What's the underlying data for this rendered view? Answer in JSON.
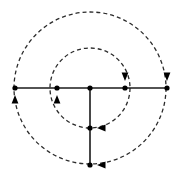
{
  "figure": {
    "background_color": "#ffffff",
    "width": 180,
    "height": 180,
    "stroke_color": "#1a1a1a",
    "dash_color": "#2b2b2b",
    "node_color": "#000000",
    "arrow_color": "#000000",
    "solid_line_width": 1.6,
    "dashed_line_width": 1.3,
    "dash_pattern": "4 3",
    "node_radius": 2.6
  },
  "geometry": {
    "center": {
      "x": 90,
      "y": 88,
      "label": "center-node"
    },
    "circles": [
      {
        "name": "inner-circle",
        "cx": 90,
        "cy": 88,
        "r": 40,
        "style": "dashed",
        "direction": "clockwise"
      },
      {
        "name": "outer-circle",
        "cx": 90,
        "cy": 88,
        "r": 76,
        "style": "dashed",
        "direction": "clockwise"
      }
    ],
    "horizontal_line": {
      "name": "horizontal-diameter",
      "x1": 15,
      "y1": 88,
      "x2": 167,
      "y2": 88,
      "style": "solid"
    },
    "vertical_line": {
      "name": "vertical-radius",
      "x1": 90,
      "y1": 88,
      "x2": 90,
      "y2": 165,
      "style": "solid"
    },
    "nodes": [
      {
        "name": "node-outer-left",
        "x": 15,
        "y": 88
      },
      {
        "name": "node-inner-left",
        "x": 57,
        "y": 88
      },
      {
        "name": "node-center",
        "x": 90,
        "y": 88
      },
      {
        "name": "node-inner-right",
        "x": 125,
        "y": 88
      },
      {
        "name": "node-outer-right",
        "x": 167,
        "y": 88
      },
      {
        "name": "node-inner-bottom",
        "x": 90,
        "y": 128
      },
      {
        "name": "node-outer-bottom",
        "x": 90,
        "y": 165
      }
    ],
    "arrows": [
      {
        "name": "arrow-outer-left-up",
        "x": 15,
        "y": 96,
        "rotation": -90,
        "meaning": "upward"
      },
      {
        "name": "arrow-inner-left-up",
        "x": 57,
        "y": 96,
        "rotation": -90,
        "meaning": "upward"
      },
      {
        "name": "arrow-inner-right-down",
        "x": 125,
        "y": 80,
        "rotation": 90,
        "meaning": "downward"
      },
      {
        "name": "arrow-outer-right-down",
        "x": 167,
        "y": 80,
        "rotation": 90,
        "meaning": "downward"
      },
      {
        "name": "arrow-inner-bottom-left",
        "x": 98,
        "y": 128,
        "rotation": 180,
        "meaning": "leftward"
      },
      {
        "name": "arrow-outer-bottom-left",
        "x": 98,
        "y": 165,
        "rotation": 180,
        "meaning": "leftward"
      }
    ]
  }
}
